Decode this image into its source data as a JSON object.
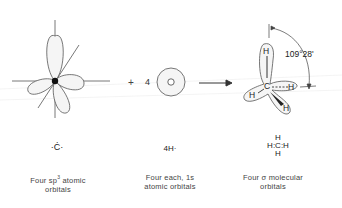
{
  "diagram": {
    "operator_plus": "+",
    "coefficient": "4",
    "arrow": "reaction-arrow",
    "angle_label": "109°28'",
    "panels": [
      {
        "id": "carbon-sp3",
        "lewis": "·Ċ·",
        "caption_line1_pre": "Four sp",
        "caption_sup": "3",
        "caption_line1_post": " atomic",
        "caption_line2": "orbitals"
      },
      {
        "id": "hydrogen-1s",
        "lewis": "4H·",
        "caption_line1": "Four each, 1s",
        "caption_line2": "atomic orbitals"
      },
      {
        "id": "methane",
        "lewis_top": "H",
        "lewis_mid": "H:C:H",
        "lewis_bottom": "H",
        "caption_line1": "Four σ molecular",
        "caption_line2": "orbitals",
        "atoms": {
          "center": "C",
          "top": "H",
          "left": "H",
          "right": "H",
          "bottom": "H"
        }
      }
    ],
    "colors": {
      "line": "#555555",
      "lobe_fill": "#f4f4f4",
      "guide_lines": "#e6e6e6"
    }
  }
}
